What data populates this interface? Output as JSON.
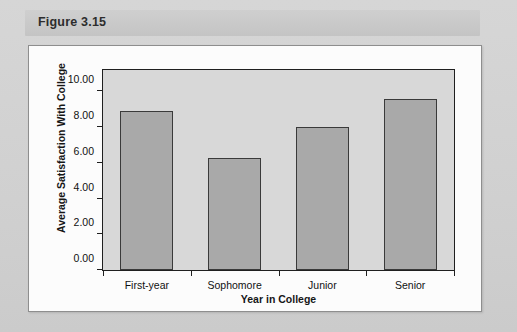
{
  "caption": {
    "label": "Figure 3.15"
  },
  "chart_data": {
    "type": "bar",
    "title": "",
    "categories": [
      "First-year",
      "Sophomore",
      "Junior",
      "Senior"
    ],
    "values": [
      8.9,
      6.3,
      8.0,
      9.6
    ],
    "xlabel": "Year in College",
    "ylabel": "Average Satisfaction With College",
    "ylim": [
      0.0,
      11.2
    ],
    "yticks": [
      0.0,
      2.0,
      4.0,
      6.0,
      8.0,
      10.0
    ],
    "ytick_labels": [
      "0.00",
      "2.00",
      "4.00",
      "6.00",
      "8.00",
      "10.00"
    ],
    "grid": false,
    "legend": false,
    "bar_fill_color": "#a9a9a9",
    "bar_edge_color": "#3a3a3a",
    "plot_background_color": "#d8d8d8",
    "axis_color": "#1f1f1f"
  }
}
